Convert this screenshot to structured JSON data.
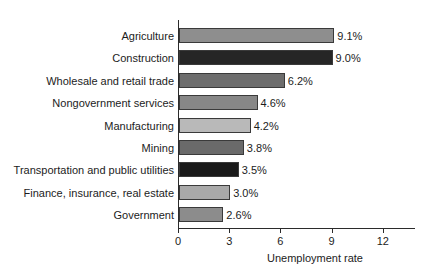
{
  "chart_data": {
    "type": "bar",
    "orientation": "horizontal",
    "title": "",
    "xlabel": "Unemployment rate",
    "ylabel": "",
    "xlim": [
      0,
      14
    ],
    "xticks": [
      0,
      3,
      6,
      9,
      12
    ],
    "xtick_labels": [
      "0",
      "3",
      "6",
      "9",
      "12"
    ],
    "grid": false,
    "legend": false,
    "categories": [
      "Agriculture",
      "Construction",
      "Wholesale and retail trade",
      "Nongovernment services",
      "Manufacturing",
      "Mining",
      "Transportation and public utilities",
      "Finance, insurance, real estate",
      "Government"
    ],
    "values": [
      9.1,
      9.0,
      6.2,
      4.6,
      4.2,
      3.8,
      3.5,
      3.0,
      2.6
    ],
    "value_labels": [
      "9.1%",
      "9.0%",
      "6.2%",
      "4.6%",
      "4.2%",
      "3.8%",
      "3.5%",
      "3.0%",
      "2.6%"
    ],
    "bar_colors": [
      "#8e8e8e",
      "#262626",
      "#6d6d6d",
      "#878787",
      "#b9b9b9",
      "#6a6a6a",
      "#1a1a1a",
      "#a9a9a9",
      "#8c8c8c"
    ],
    "axis_color": "#2b2b2b",
    "text_color": "#1c1c1c",
    "background": "#ffffff"
  }
}
